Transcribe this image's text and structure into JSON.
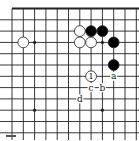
{
  "diagram": {
    "type": "go-board-fragment",
    "grid": {
      "cols": 12,
      "rows": 12,
      "origin_x": 12,
      "origin_y": 8.5,
      "spacing": 11.3,
      "top_edge": true,
      "right_edge": false,
      "line_color": "#222222"
    },
    "star_points": [
      {
        "col": 2,
        "row": 3
      },
      {
        "col": 8,
        "row": 3
      },
      {
        "col": 2,
        "row": 9
      },
      {
        "col": 8,
        "row": 9
      }
    ],
    "stones": [
      {
        "color": "white",
        "col": 1,
        "row": 3
      },
      {
        "color": "white",
        "col": 6,
        "row": 2
      },
      {
        "color": "white",
        "col": 6,
        "row": 3
      },
      {
        "color": "white",
        "col": 7,
        "row": 3
      },
      {
        "color": "black",
        "col": 7,
        "row": 2
      },
      {
        "color": "black",
        "col": 8,
        "row": 2
      },
      {
        "color": "black",
        "col": 9,
        "row": 3
      },
      {
        "color": "black",
        "col": 9,
        "row": 5
      },
      {
        "color": "white",
        "col": 7,
        "row": 6,
        "label": "1"
      }
    ],
    "labels": [
      {
        "text": "a",
        "col": 9,
        "row": 6
      },
      {
        "text": "b",
        "col": 8,
        "row": 7
      },
      {
        "text": "c",
        "col": 7,
        "row": 7
      },
      {
        "text": "d",
        "col": 6,
        "row": 8
      }
    ],
    "colors": {
      "black_stone": "#000000",
      "white_stone": "#ffffff",
      "stone_outline": "#222222",
      "background": "#ffffff"
    }
  }
}
